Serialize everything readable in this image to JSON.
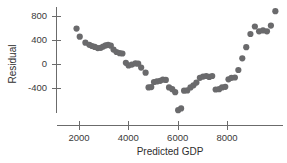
{
  "chart_data": {
    "type": "scatter",
    "title": "",
    "subtitle": "",
    "xlabel": "Predicted GDP",
    "ylabel": "Residual",
    "xlim": [
      1300,
      10200
    ],
    "ylim": [
      -900,
      1000
    ],
    "xticks": [
      2000,
      4000,
      6000,
      8000
    ],
    "xtick_labels": [
      "2000",
      "4000",
      "6000",
      "8000"
    ],
    "yticks": [
      -400,
      0,
      400,
      800
    ],
    "ytick_labels": [
      "-400",
      "0",
      "400",
      "800"
    ],
    "grid": false,
    "legend": null,
    "marker_color": "#6a6a6c",
    "axis_color": "#6b6b6b",
    "marker_size": 3.1,
    "series": [
      {
        "name": "residuals",
        "x": [
          1900,
          2030,
          2260,
          2420,
          2530,
          2640,
          2760,
          2880,
          2980,
          3080,
          3180,
          3290,
          3400,
          3520,
          3650,
          3760,
          3900,
          4010,
          4140,
          4290,
          4400,
          4520,
          4700,
          4820,
          4930,
          5040,
          5160,
          5290,
          5400,
          5520,
          5650,
          5780,
          5900,
          6020,
          6140,
          6260,
          6390,
          6520,
          6640,
          6760,
          6900,
          7030,
          7160,
          7280,
          7400,
          7540,
          7680,
          7800,
          7930,
          8060,
          8180,
          8320,
          8460,
          8620,
          8780,
          8950,
          9130,
          9300,
          9460,
          9620,
          9780,
          9960
        ],
        "y": [
          590,
          455,
          355,
          320,
          300,
          285,
          265,
          270,
          290,
          310,
          320,
          305,
          240,
          200,
          180,
          175,
          20,
          -25,
          -10,
          10,
          5,
          -60,
          -145,
          -390,
          -385,
          -300,
          -290,
          -280,
          -260,
          -265,
          -390,
          -420,
          -470,
          -770,
          -740,
          -445,
          -440,
          -390,
          -355,
          -310,
          -230,
          -210,
          -200,
          -215,
          -200,
          -425,
          -420,
          -390,
          -380,
          -255,
          -230,
          -225,
          -100,
          95,
          280,
          500,
          625,
          545,
          560,
          545,
          640,
          880
        ]
      }
    ]
  },
  "figure": {
    "background": "#ffffff",
    "plot_area": {
      "left": 52,
      "right": 283,
      "top": 6,
      "bottom": 121
    }
  }
}
